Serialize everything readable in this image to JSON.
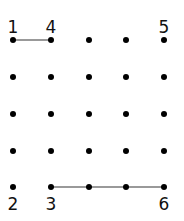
{
  "grid": {
    "cols": [
      13,
      51,
      89,
      126,
      164
    ],
    "rows": [
      40,
      77,
      114,
      151,
      187
    ],
    "dot_color": "#000000",
    "line_color": "#999999"
  },
  "segments": [
    {
      "from": [
        0,
        0
      ],
      "to": [
        1,
        0
      ]
    },
    {
      "from": [
        1,
        4
      ],
      "to": [
        4,
        4
      ]
    }
  ],
  "labels": [
    {
      "text": "1",
      "col": 0,
      "pos": "above"
    },
    {
      "text": "4",
      "col": 1,
      "pos": "above"
    },
    {
      "text": "5",
      "col": 4,
      "pos": "above"
    },
    {
      "text": "2",
      "col": 0,
      "pos": "below"
    },
    {
      "text": "3",
      "col": 1,
      "pos": "below"
    },
    {
      "text": "6",
      "col": 4,
      "pos": "below"
    }
  ]
}
